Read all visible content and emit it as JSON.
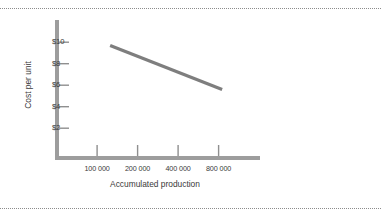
{
  "chart_data": {
    "type": "line",
    "title": "",
    "xlabel": "Accumulated production",
    "ylabel": "Cost per unit",
    "x_scale": "log",
    "x_tick_labels": [
      "100 000",
      "200 000",
      "400 000",
      "800 000"
    ],
    "x_tick_values": [
      100000,
      200000,
      400000,
      800000
    ],
    "y_tick_labels": [
      "$10",
      "$8",
      "$6",
      "$4",
      "$2"
    ],
    "y_tick_values": [
      10,
      8,
      6,
      4,
      2
    ],
    "ylim": [
      0,
      11
    ],
    "grid": false,
    "legend": null,
    "series": [
      {
        "name": "Experience curve",
        "x": [
          125000,
          850000
        ],
        "y": [
          9.7,
          5.6
        ],
        "points": [
          {
            "x": 125000,
            "y": 9.7
          },
          {
            "x": 850000,
            "y": 5.6
          }
        ]
      }
    ],
    "annotations": []
  },
  "figure": {
    "y_axis_label": "Cost per unit",
    "x_axis_label": "Accumulated production",
    "y_ticks": [
      {
        "label": "$10",
        "value": 10
      },
      {
        "label": "$8",
        "value": 8
      },
      {
        "label": "$6",
        "value": 6
      },
      {
        "label": "$4",
        "value": 4
      },
      {
        "label": "$2",
        "value": 2
      }
    ],
    "x_ticks": [
      {
        "label": "100 000",
        "value": 100000
      },
      {
        "label": "200 000",
        "value": 200000
      },
      {
        "label": "400 000",
        "value": 400000
      },
      {
        "label": "800 000",
        "value": 800000
      }
    ],
    "colors": {
      "axis": "#9d9d9d",
      "line": "#7e7e7e",
      "tick": "#8f8f8f",
      "text": "#3a3a3a",
      "rule": "#8c8c8c",
      "background": "#ffffff"
    }
  }
}
